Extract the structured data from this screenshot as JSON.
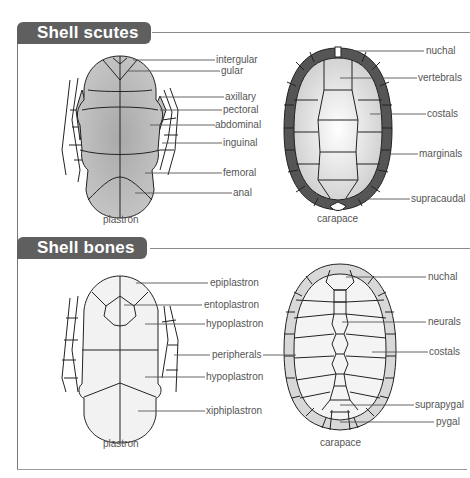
{
  "sections": [
    {
      "title": "Shell scutes",
      "plastron": {
        "caption": "plastron",
        "labels": [
          "intergular",
          "gular",
          "axillary",
          "pectoral",
          "abdominal",
          "inguinal",
          "femoral",
          "anal"
        ]
      },
      "carapace": {
        "caption": "carapace",
        "labels": [
          "nuchal",
          "vertebrals",
          "costals",
          "marginals",
          "supracaudal"
        ]
      }
    },
    {
      "title": "Shell bones",
      "plastron": {
        "caption": "plastron",
        "labels": [
          "epiplastron",
          "entoplastron",
          "hypoplastron",
          "peripherals",
          "hypoplastron",
          "xiphiplastron"
        ]
      },
      "carapace": {
        "caption": "carapace",
        "labels": [
          "nuchal",
          "neurals",
          "costals",
          "suprapygal",
          "pygal"
        ]
      }
    }
  ],
  "colors": {
    "header_bg": "#5f5f5f",
    "scute_fill": "#bdbdbd",
    "marginal_fill": "#555555",
    "bone_fill": "#f2f2f2",
    "bone_edge_fill": "#d8d8d8"
  }
}
